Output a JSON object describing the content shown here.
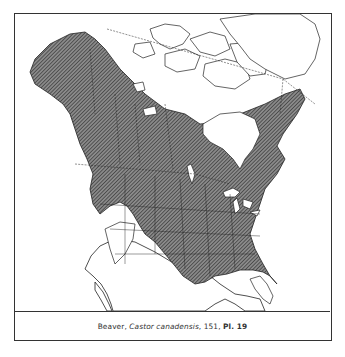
{
  "figure": {
    "type": "range-map",
    "region": "North America",
    "legend": {
      "range_fill": "diagonal hatch",
      "hatch_color": "#555555",
      "outline_color": "#222222"
    },
    "caption": {
      "common_name": "Beaver",
      "separator1": ", ",
      "scientific_name": "Castor canadensis",
      "separator2": ", ",
      "page": "151",
      "separator3": ", ",
      "plate": "Pl. 19"
    }
  }
}
